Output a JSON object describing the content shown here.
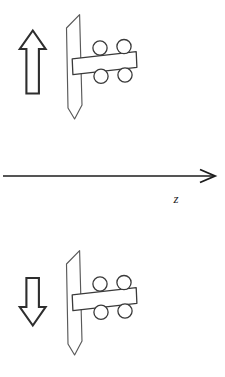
{
  "figure": {
    "caption_text": "",
    "background_color": "#ffffff",
    "ink_color": "#2b2b2b",
    "axis": {
      "label": "z",
      "label_x": 176,
      "label_y": 203,
      "line_x1": 3,
      "line_x2": 214,
      "line_y": 176,
      "head_length": 13,
      "head_half_height": 7,
      "direction": "right"
    },
    "panels": [
      {
        "id": "upper",
        "name": "spin-up-configuration",
        "arrow": {
          "name": "magnetic-moment-arrow-up",
          "direction": "up",
          "label": "",
          "x": 20,
          "y": 30,
          "width": 26,
          "height": 64
        },
        "plate": {
          "name": "deflection-plate",
          "x": 66,
          "y": 14,
          "width": 16,
          "height": 105
        },
        "bar": {
          "name": "support-bar",
          "x1": 72,
          "y1": 55,
          "x2": 136,
          "y2": 50,
          "thickness": 16
        },
        "wheels": [
          {
            "name": "wheel-top-left",
            "cx": 100,
            "cy": 48,
            "r": 7
          },
          {
            "name": "wheel-top-right",
            "cx": 124,
            "cy": 47,
            "r": 7
          },
          {
            "name": "wheel-bottom-left",
            "cx": 101,
            "cy": 76,
            "r": 7
          },
          {
            "name": "wheel-bottom-right",
            "cx": 125,
            "cy": 75,
            "r": 7
          }
        ]
      },
      {
        "id": "lower",
        "name": "spin-down-configuration",
        "arrow": {
          "name": "magnetic-moment-arrow-down",
          "direction": "down",
          "label": "",
          "x": 20,
          "y": 277,
          "width": 26,
          "height": 64
        },
        "plate": {
          "name": "deflection-plate",
          "x": 66,
          "y": 250,
          "width": 16,
          "height": 105
        },
        "bar": {
          "name": "support-bar",
          "x1": 72,
          "y1": 291,
          "x2": 136,
          "y2": 286,
          "thickness": 16
        },
        "wheels": [
          {
            "name": "wheel-top-left",
            "cx": 100,
            "cy": 284,
            "r": 7
          },
          {
            "name": "wheel-top-right",
            "cx": 124,
            "cy": 283,
            "r": 7
          },
          {
            "name": "wheel-bottom-left",
            "cx": 101,
            "cy": 312,
            "r": 7
          },
          {
            "name": "wheel-bottom-right",
            "cx": 125,
            "cy": 311,
            "r": 7
          }
        ]
      }
    ]
  }
}
